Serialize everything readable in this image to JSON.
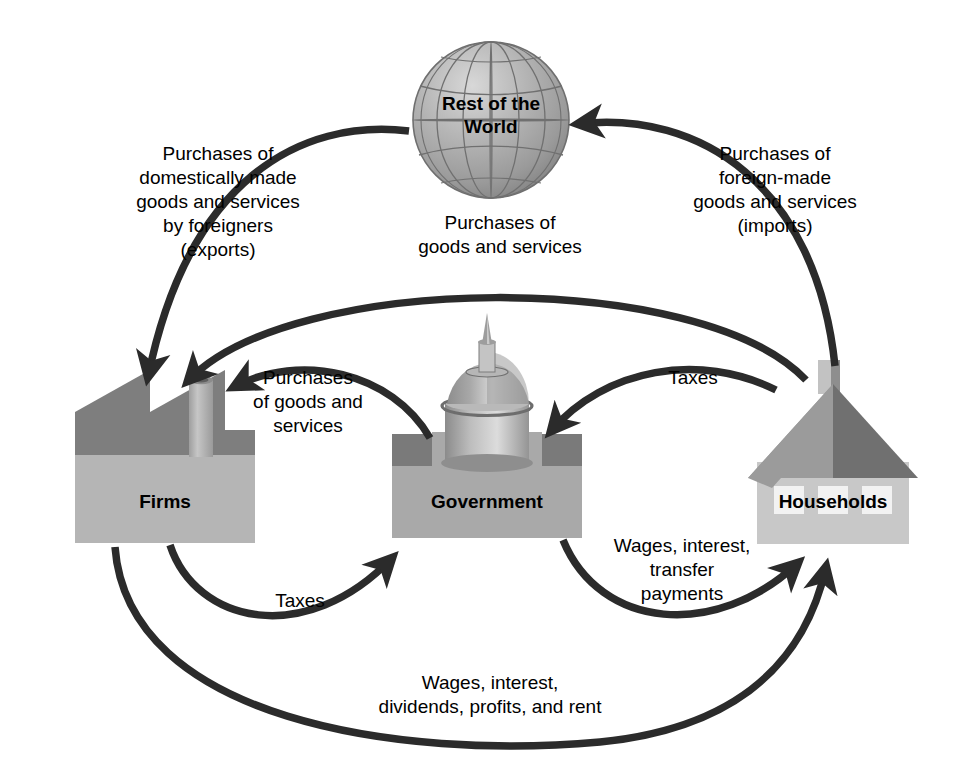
{
  "diagram": {
    "colors": {
      "arrow": "#2b2b2b",
      "background": "#ffffff",
      "text": "#000000",
      "globe_light": "#c9c9c9",
      "globe_mid": "#a8a8a8",
      "globe_dark": "#8f8f8f",
      "globe_line": "#6f6f6f",
      "firms_light": "#b5b5b5",
      "firms_dark": "#7d7d7d",
      "firms_stack": "#bdbdbd",
      "gov_base": "#a9a9a9",
      "gov_dark": "#767676",
      "gov_dome_light": "#d2d2d2",
      "gov_dome_mid": "#a5a5a5",
      "gov_dome_dark": "#8a8a8a",
      "house_wall": "#c8c8c8",
      "house_roof_light": "#9a9a9a",
      "house_roof_dark": "#6e6e6e",
      "house_window": "#f2f2f2"
    },
    "nodes": [
      {
        "id": "rest-of-world",
        "label": "Rest of the\nWorld",
        "icon": "globe-icon"
      },
      {
        "id": "firms",
        "label": "Firms",
        "icon": "factory-icon"
      },
      {
        "id": "government",
        "label": "Government",
        "icon": "capitol-icon"
      },
      {
        "id": "households",
        "label": "Households",
        "icon": "house-icon"
      }
    ],
    "flows": [
      {
        "id": "exports",
        "label": "Purchases of\ndomestically made\ngoods and services\nby foreigners\n(exports)",
        "from": "rest-of-world",
        "to": "firms"
      },
      {
        "id": "imports",
        "label": "Purchases of\nforeign-made\ngoods and services\n(imports)",
        "from": "households",
        "to": "rest-of-world"
      },
      {
        "id": "household-purchases",
        "label": "Purchases of\ngoods and services",
        "from": "households",
        "to": "firms"
      },
      {
        "id": "government-purchases",
        "label": "Purchases\nof goods and\nservices",
        "from": "government",
        "to": "firms"
      },
      {
        "id": "household-taxes",
        "label": "Taxes",
        "from": "households",
        "to": "government"
      },
      {
        "id": "firm-taxes",
        "label": "Taxes",
        "from": "firms",
        "to": "government"
      },
      {
        "id": "transfers",
        "label": "Wages, interest,\ntransfer\npayments",
        "from": "government",
        "to": "households"
      },
      {
        "id": "factor-income",
        "label": "Wages, interest,\ndividends, profits, and rent",
        "from": "firms",
        "to": "households"
      }
    ],
    "labels": {
      "exports": "Purchases of\ndomestically made\ngoods and services\nby foreigners\n(exports)",
      "imports": "Purchases of\nforeign-made\ngoods and services\n(imports)",
      "household_purchases": "Purchases of\ngoods and services",
      "government_purchases": "Purchases\nof goods and\nservices",
      "taxes_households": "Taxes",
      "taxes_firms": "Taxes",
      "transfers": "Wages, interest,\ntransfer\npayments",
      "factor_income": "Wages, interest,\ndividends, profits, and rent",
      "node_rest_of_world": "Rest of the\nWorld",
      "node_firms": "Firms",
      "node_government": "Government",
      "node_households": "Households"
    }
  }
}
